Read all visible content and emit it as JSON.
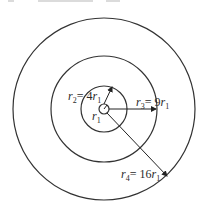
{
  "diagram": {
    "type": "concentric-circles",
    "top_caption_fragment": "r1 = 0.2 … = … m",
    "center": [
      104,
      109
    ],
    "stroke_color": "#333333",
    "circles": [
      {
        "name": "r1",
        "radius_px": 5
      },
      {
        "name": "r2",
        "radius_px": 23
      },
      {
        "name": "r3",
        "radius_px": 53
      },
      {
        "name": "r4",
        "radius_px": 91
      }
    ],
    "labels": {
      "r1": {
        "var": "r",
        "sub": "1"
      },
      "r2": {
        "var": "r",
        "sub": "2",
        "eq": "= 4",
        "unit_var": "r",
        "unit_sub": "1"
      },
      "r3": {
        "var": "r",
        "sub": "3",
        "eq": "= 9",
        "unit_var": "r",
        "unit_sub": "1"
      },
      "r4": {
        "var": "r",
        "sub": "4",
        "eq": "= 16",
        "unit_var": "r",
        "unit_sub": "1"
      }
    }
  }
}
